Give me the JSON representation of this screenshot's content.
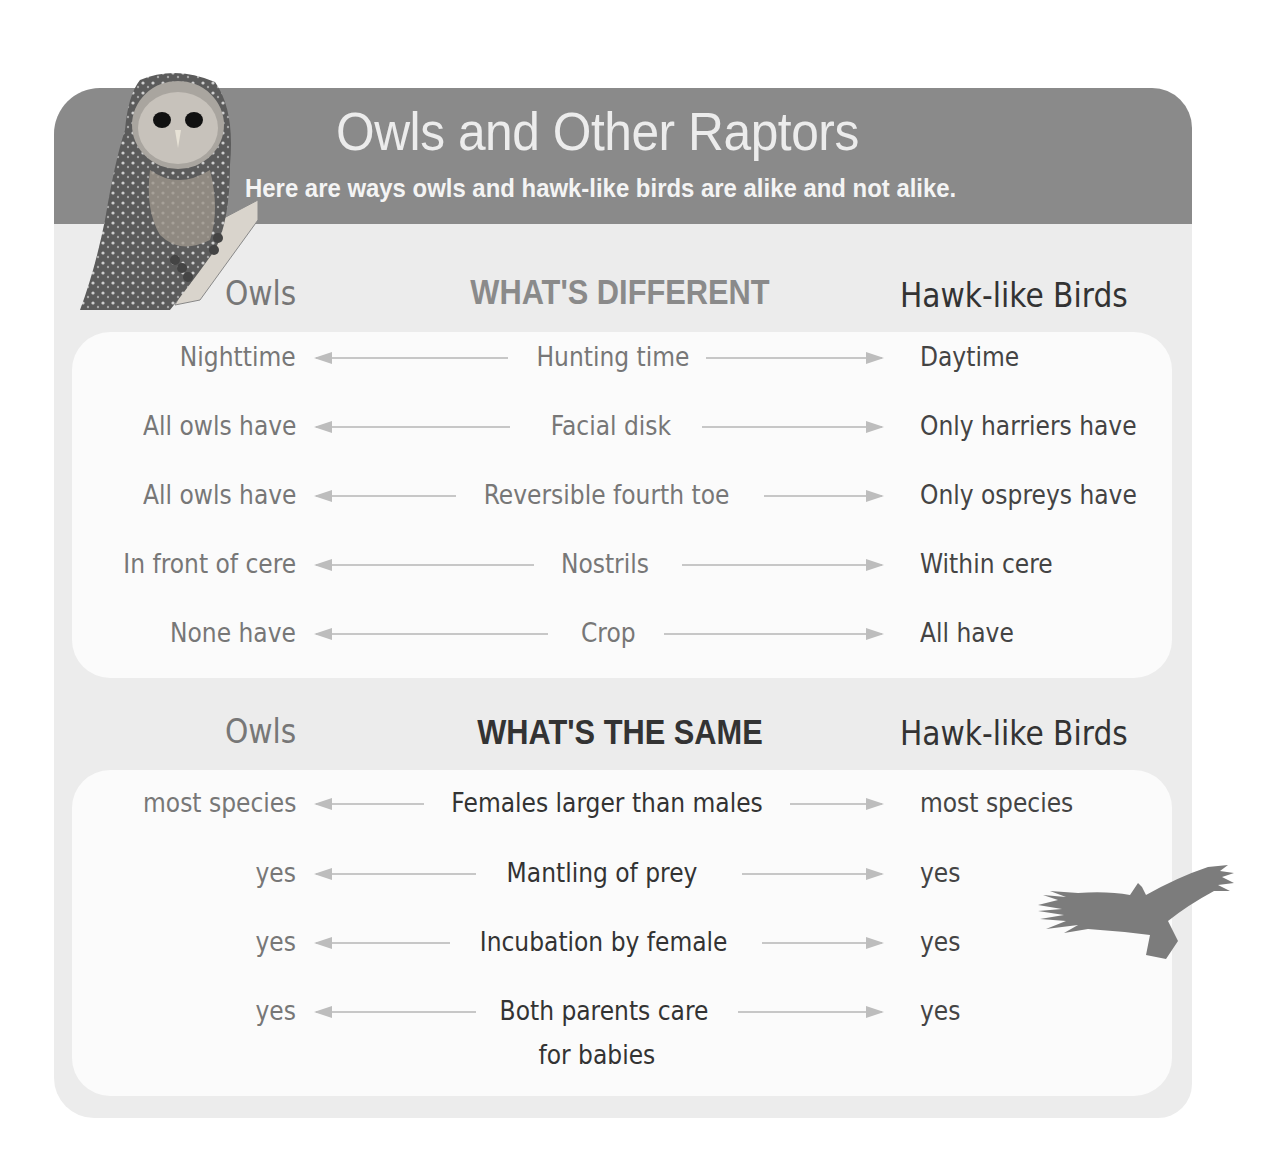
{
  "header": {
    "title": "Owls and Other Raptors",
    "subtitle": "Here are ways owls and hawk-like birds are alike and not alike."
  },
  "different": {
    "left_heading": "Owls",
    "heading": "WHAT'S DIFFERENT",
    "right_heading": "Hawk-like Birds",
    "rows": [
      {
        "owls": "Nighttime",
        "trait": "Hunting time",
        "hawks": "Daytime"
      },
      {
        "owls": "All owls have",
        "trait": "Facial disk",
        "hawks": "Only harriers have"
      },
      {
        "owls": "All owls have",
        "trait": "Reversible fourth toe",
        "hawks": "Only ospreys have"
      },
      {
        "owls": "In front of cere",
        "trait": "Nostrils",
        "hawks": "Within cere"
      },
      {
        "owls": "None have",
        "trait": "Crop",
        "hawks": "All have"
      }
    ]
  },
  "same": {
    "left_heading": "Owls",
    "heading": "WHAT'S THE SAME",
    "right_heading": "Hawk-like Birds",
    "rows": [
      {
        "owls": "most species",
        "trait": "Females larger than males",
        "hawks": "most species"
      },
      {
        "owls": "yes",
        "trait": "Mantling of prey",
        "hawks": "yes"
      },
      {
        "owls": "yes",
        "trait": "Incubation by female",
        "hawks": "yes"
      },
      {
        "owls": "yes",
        "trait": "Both parents care",
        "trait_line2": "for babies",
        "hawks": "yes"
      }
    ]
  },
  "images": {
    "owl": "barred-owl-photo",
    "hawk": "soaring-raptor-silhouette"
  },
  "colors": {
    "header_band": "#8a8a8a",
    "card_bg": "#ececec",
    "panel_bg": "#fbfbfb",
    "arrow": "#c7c7c7"
  }
}
